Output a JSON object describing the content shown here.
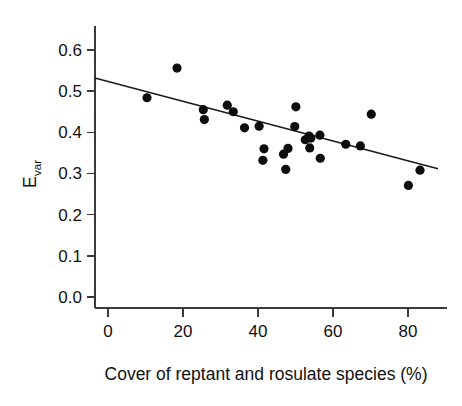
{
  "chart_data": {
    "type": "scatter",
    "title": "",
    "xlabel": "Cover of reptant and rosulate species (%)",
    "ylabel": "Evar",
    "ylabel_base": "E",
    "ylabel_sub": "var",
    "xlim": [
      -5,
      88
    ],
    "ylim": [
      -0.02,
      0.65
    ],
    "xticks": [
      0,
      20,
      40,
      60,
      80
    ],
    "xtick_labels": [
      "0",
      "20",
      "40",
      "60",
      "80"
    ],
    "yticks": [
      0.0,
      0.1,
      0.2,
      0.3,
      0.4,
      0.5,
      0.6
    ],
    "ytick_labels": [
      "0.0",
      "0.1",
      "0.2",
      "0.3",
      "0.4",
      "0.5",
      "0.6"
    ],
    "grid": false,
    "legend": false,
    "point_color": "#0c0c0c",
    "line_color": "#1a1a1a",
    "axis_color": "#3a3a3a",
    "marker_radius_px": 4.6,
    "points": [
      {
        "x": 10.4,
        "y": 0.484
      },
      {
        "x": 18.4,
        "y": 0.556
      },
      {
        "x": 25.4,
        "y": 0.455
      },
      {
        "x": 25.7,
        "y": 0.431
      },
      {
        "x": 31.8,
        "y": 0.466
      },
      {
        "x": 33.4,
        "y": 0.45
      },
      {
        "x": 36.4,
        "y": 0.411
      },
      {
        "x": 40.3,
        "y": 0.415
      },
      {
        "x": 41.6,
        "y": 0.36
      },
      {
        "x": 41.3,
        "y": 0.332
      },
      {
        "x": 46.8,
        "y": 0.347
      },
      {
        "x": 47.4,
        "y": 0.31
      },
      {
        "x": 48.0,
        "y": 0.361
      },
      {
        "x": 49.8,
        "y": 0.414
      },
      {
        "x": 50.1,
        "y": 0.462
      },
      {
        "x": 52.6,
        "y": 0.382
      },
      {
        "x": 53.6,
        "y": 0.391
      },
      {
        "x": 54.1,
        "y": 0.386
      },
      {
        "x": 53.8,
        "y": 0.362
      },
      {
        "x": 56.5,
        "y": 0.393
      },
      {
        "x": 56.6,
        "y": 0.337
      },
      {
        "x": 63.4,
        "y": 0.371
      },
      {
        "x": 67.3,
        "y": 0.367
      },
      {
        "x": 70.2,
        "y": 0.444
      },
      {
        "x": 80.1,
        "y": 0.271
      },
      {
        "x": 83.2,
        "y": 0.308
      }
    ],
    "fit_line": {
      "x_start": -3.5,
      "y_start": 0.532,
      "x_end": 88.0,
      "y_end": 0.3115
    }
  }
}
